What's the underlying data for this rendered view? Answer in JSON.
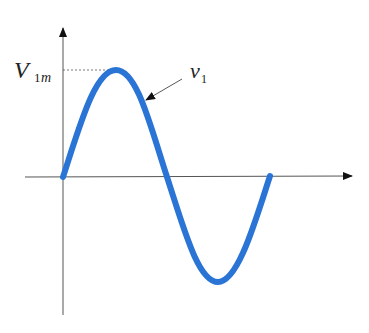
{
  "diagram": {
    "labels": {
      "amplitude_main": "V",
      "amplitude_sub_1": "1",
      "amplitude_sub_m": "m",
      "curve_main": "v",
      "curve_sub": "1"
    },
    "colors": {
      "curve": "#2a74d6",
      "axis": "#444444",
      "dashed": "#555555",
      "text": "#222222"
    },
    "axes": {
      "x_axis": "time axis (horizontal, arrow right)",
      "y_axis": "voltage axis (vertical, arrow up)"
    },
    "waveform": {
      "type": "sine",
      "cycles": 1,
      "amplitude_label": "V1m",
      "curve_label": "v1"
    }
  }
}
